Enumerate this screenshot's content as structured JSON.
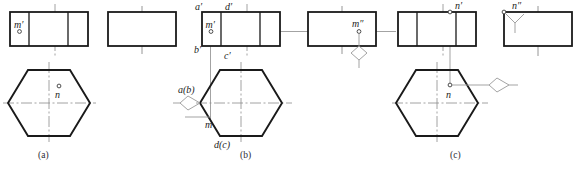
{
  "figure": {
    "panels": [
      {
        "id": "a",
        "caption": "(a)",
        "labels": [
          {
            "name": "m-prime",
            "text": "m",
            "prime": "′"
          },
          {
            "name": "n",
            "text": "n",
            "prime": ""
          }
        ]
      },
      {
        "id": "b",
        "caption": "(b)",
        "labels": [
          {
            "name": "a-prime",
            "text": "a",
            "prime": "′"
          },
          {
            "name": "d-prime",
            "text": "d",
            "prime": "′"
          },
          {
            "name": "b-prime",
            "text": "b",
            "prime": "′"
          },
          {
            "name": "c-prime",
            "text": "c",
            "prime": "′"
          },
          {
            "name": "m-prime",
            "text": "m",
            "prime": "′"
          },
          {
            "name": "m-double-prime",
            "text": "m",
            "prime": "″"
          },
          {
            "name": "a-b",
            "text": "a(b)",
            "prime": ""
          },
          {
            "name": "m",
            "text": "m",
            "prime": ""
          },
          {
            "name": "d-c",
            "text": "d(c)",
            "prime": ""
          }
        ]
      },
      {
        "id": "c",
        "caption": "(c)",
        "labels": [
          {
            "name": "n-prime",
            "text": "n",
            "prime": "′"
          },
          {
            "name": "n-double-prime",
            "text": "n",
            "prime": "″"
          },
          {
            "name": "n",
            "text": "n",
            "prime": ""
          }
        ]
      }
    ],
    "colors": {
      "outline": "#1a1a1a",
      "thin_line": "#555555",
      "center_line": "#777777",
      "projection_line": "#888888",
      "caption": "#2b2b33",
      "background": "#ffffff"
    }
  },
  "captions": {
    "a": "(a)",
    "b": "(b)",
    "c": "(c)"
  },
  "labels": {
    "a_m_prime": "m′",
    "a_n": "n",
    "b_a_prime": "a′",
    "b_d_prime": "d′",
    "b_b_prime": "b′",
    "b_c_prime": "c′",
    "b_m_prime": "m′",
    "b_m_dprime": "m″",
    "b_ab": "a(b)",
    "b_m": "m",
    "b_dc": "d(c)",
    "c_n_prime": "n′",
    "c_n_dprime": "n″",
    "c_n": "n"
  }
}
